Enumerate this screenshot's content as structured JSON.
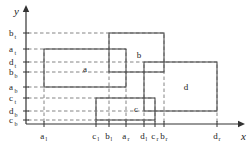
{
  "figure": {
    "type": "geometric-diagram",
    "background_color": "#ffffff",
    "line_color": "#4d4d4d",
    "dash_color": "#666666",
    "axis_color": "#333333"
  },
  "axes": {
    "x_label": "x",
    "y_label": "y",
    "origin": {
      "x": 26,
      "y": 124
    },
    "x_end": {
      "x": 238,
      "y": 124
    },
    "y_end": {
      "x": 26,
      "y": 12
    }
  },
  "y_ticks": [
    {
      "base": "b",
      "sub": "t",
      "y": 33
    },
    {
      "base": "a",
      "sub": "t",
      "y": 49
    },
    {
      "base": "d",
      "sub": "t",
      "y": 62
    },
    {
      "base": "b",
      "sub": "b",
      "y": 72
    },
    {
      "base": "a",
      "sub": "b",
      "y": 87
    },
    {
      "base": "c",
      "sub": "t",
      "y": 98
    },
    {
      "base": "d",
      "sub": "b",
      "y": 111
    },
    {
      "base": "c",
      "sub": "b",
      "y": 120
    }
  ],
  "x_ticks": [
    {
      "base": "a",
      "sub": "l",
      "x": 44
    },
    {
      "base": "c",
      "sub": "l",
      "x": 96
    },
    {
      "base": "b",
      "sub": "l",
      "x": 109
    },
    {
      "base": "a",
      "sub": "r",
      "x": 126
    },
    {
      "base": "d",
      "sub": "l",
      "x": 144
    },
    {
      "base": "c",
      "sub": "r",
      "x": 155
    },
    {
      "base": "b",
      "sub": "r",
      "x": 164
    },
    {
      "base": "d",
      "sub": "r",
      "x": 217
    }
  ],
  "rectangles": [
    {
      "name": "a",
      "left": 44,
      "right": 126,
      "top": 49,
      "bottom": 87,
      "label_x": 85,
      "label_y": 72
    },
    {
      "name": "b",
      "left": 109,
      "right": 164,
      "top": 33,
      "bottom": 72,
      "label_x": 139,
      "label_y": 58
    },
    {
      "name": "c",
      "left": 96,
      "right": 155,
      "top": 98,
      "bottom": 120,
      "label_x": 136,
      "label_y": 112
    },
    {
      "name": "d",
      "left": 144,
      "right": 217,
      "top": 62,
      "bottom": 111,
      "label_x": 186,
      "label_y": 90
    }
  ],
  "chart_data": {
    "type": "scatter",
    "title": "",
    "xlabel": "x",
    "ylabel": "y",
    "grid": false,
    "legend": "none",
    "categories": [
      "a",
      "b",
      "c",
      "d"
    ],
    "series": [
      {
        "name": "a",
        "x_left": "a_l",
        "x_right": "a_r",
        "y_bottom": "a_b",
        "y_top": "a_t"
      },
      {
        "name": "b",
        "x_left": "b_l",
        "x_right": "b_r",
        "y_bottom": "b_b",
        "y_top": "b_t"
      },
      {
        "name": "c",
        "x_left": "c_l",
        "x_right": "c_r",
        "y_bottom": "c_b",
        "y_top": "c_t"
      },
      {
        "name": "d",
        "x_left": "d_l",
        "x_right": "d_r",
        "y_bottom": "d_b",
        "y_top": "d_t"
      }
    ],
    "x_tick_labels": [
      "a_l",
      "c_l",
      "b_l",
      "a_r",
      "d_l",
      "c_r",
      "b_r",
      "d_r"
    ],
    "y_tick_labels": [
      "b_t",
      "a_t",
      "d_t",
      "b_b",
      "a_b",
      "c_t",
      "d_b",
      "c_b"
    ]
  }
}
